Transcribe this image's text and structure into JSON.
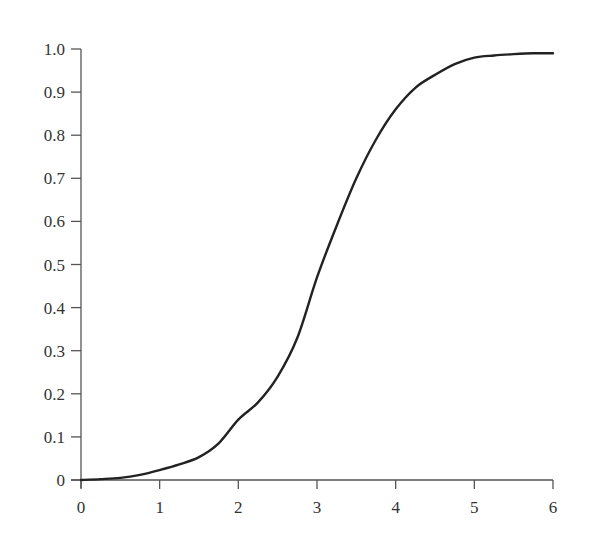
{
  "chart_data": {
    "type": "line",
    "title": "",
    "xlabel": "",
    "ylabel": "",
    "xlim": [
      0,
      6
    ],
    "ylim": [
      0,
      1.0
    ],
    "grid": false,
    "legend": null,
    "x_ticks": [
      "0",
      "1",
      "2",
      "3",
      "4",
      "5",
      "6"
    ],
    "y_ticks": [
      "0",
      "0.1",
      "0.2",
      "0.3",
      "0.4",
      "0.5",
      "0.6",
      "0.7",
      "0.8",
      "0.9",
      "1.0"
    ],
    "series": [
      {
        "name": "S-curve (sigmoid)",
        "color": "#222222",
        "x": [
          0,
          0.25,
          0.5,
          0.75,
          1.0,
          1.25,
          1.5,
          1.75,
          2.0,
          2.25,
          2.5,
          2.75,
          3.0,
          3.25,
          3.5,
          3.75,
          4.0,
          4.25,
          4.5,
          4.75,
          5.0,
          5.25,
          5.5,
          5.75,
          6.0
        ],
        "y": [
          0.0,
          0.002,
          0.005,
          0.012,
          0.023,
          0.036,
          0.053,
          0.085,
          0.14,
          0.18,
          0.24,
          0.33,
          0.47,
          0.59,
          0.7,
          0.79,
          0.86,
          0.91,
          0.94,
          0.965,
          0.98,
          0.985,
          0.988,
          0.99,
          0.99
        ]
      }
    ]
  },
  "colors": {
    "background": "#ffffff",
    "axis": "#555555",
    "text": "#333333",
    "curve": "#222222"
  }
}
